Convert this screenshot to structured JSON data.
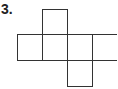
{
  "problem": {
    "number_label": "3.",
    "figure": "cube net",
    "squares": [
      {
        "row": 0,
        "col": 1
      },
      {
        "row": 1,
        "col": 0
      },
      {
        "row": 1,
        "col": 1
      },
      {
        "row": 1,
        "col": 2
      },
      {
        "row": 1,
        "col": 3
      },
      {
        "row": 2,
        "col": 2
      }
    ],
    "stroke_color": "#333333"
  }
}
